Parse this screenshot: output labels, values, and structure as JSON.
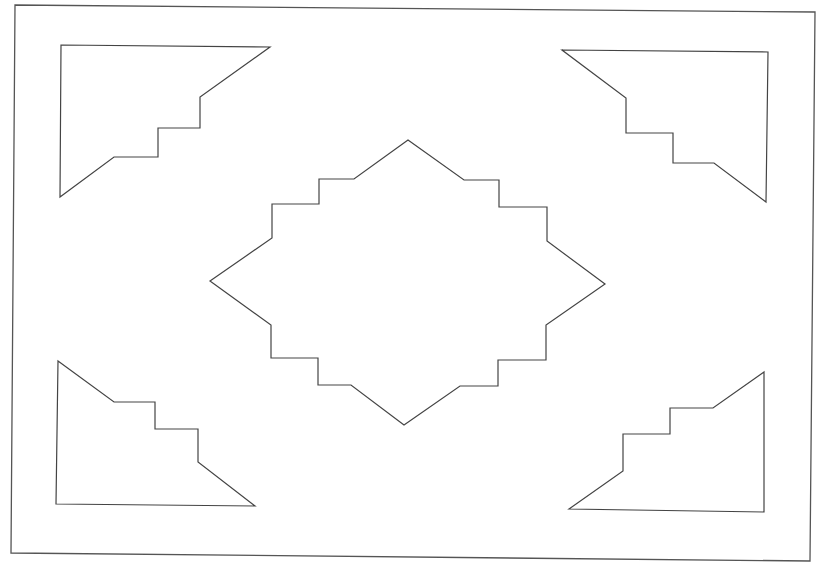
{
  "diagram": {
    "background": "#ffffff",
    "stroke_color": "#444444",
    "frame": {
      "points": "15,5 815,12 810,561 11,553"
    },
    "shapes": [
      {
        "id": "corner-top-left",
        "points": "61,45 270,47 200,97 200,128 158,128 158,157 114,157 60,197"
      },
      {
        "id": "corner-top-right",
        "points": "562,50 768,52 766,202 714,163 673,163 673,133 626,133 626,98"
      },
      {
        "id": "corner-bottom-left",
        "points": "58,361 114,402 155,402 155,429 198,429 198,462 255,506 56,504"
      },
      {
        "id": "corner-bottom-right",
        "points": "569,509 623,471 623,434 670,434 670,408 713,408 764,372 764,512"
      },
      {
        "id": "center-medallion",
        "points": "210,281 272,238 272,204 319,204 319,179 354,179 408,140 464,180 499,180 499,207 547,207 547,241 605,284 546,325 546,360 498,360 498,386 460,386 404,425 351,385 318,385 318,358 271,358 271,325"
      }
    ]
  }
}
